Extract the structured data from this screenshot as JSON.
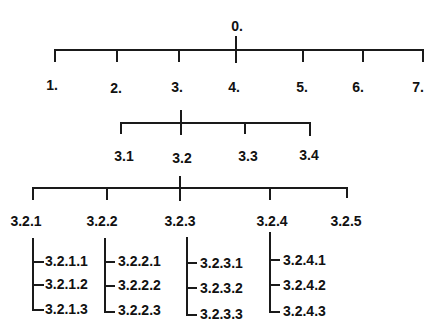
{
  "diagram": {
    "type": "hierarchy-tree",
    "root": {
      "label": "0.",
      "x": 236
    },
    "level1": [
      {
        "label": "1.",
        "x": 54
      },
      {
        "label": "2.",
        "x": 117
      },
      {
        "label": "3.",
        "x": 179
      },
      {
        "label": "4.",
        "x": 235
      },
      {
        "label": "5.",
        "x": 302
      },
      {
        "label": "6.",
        "x": 363
      },
      {
        "label": "7.",
        "x": 423
      }
    ],
    "level2": [
      {
        "label": "3.1",
        "x": 121
      },
      {
        "label": "3.2",
        "x": 181
      },
      {
        "label": "3.3",
        "x": 245
      },
      {
        "label": "3.4",
        "x": 310
      }
    ],
    "level3": [
      {
        "label": "3.2.1",
        "x": 33
      },
      {
        "label": "3.2.2",
        "x": 107
      },
      {
        "label": "3.2.3",
        "x": 180
      },
      {
        "label": "3.2.4",
        "x": 270
      },
      {
        "label": "3.2.5",
        "x": 347
      }
    ],
    "level4": [
      {
        "parent": "3.2.1",
        "x": 33,
        "items": [
          "3.2.1.1",
          "3.2.1.2",
          "3.2.1.3"
        ]
      },
      {
        "parent": "3.2.2",
        "x": 104,
        "items": [
          "3.2.2.1",
          "3.2.2.2",
          "3.2.2.3"
        ]
      },
      {
        "parent": "3.2.3",
        "x": 186,
        "items": [
          "3.2.3.1",
          "3.2.3.2",
          "3.2.3.3"
        ]
      },
      {
        "parent": "3.2.4",
        "x": 270,
        "items": [
          "3.2.4.1",
          "3.2.4.2",
          "3.2.4.3"
        ]
      }
    ]
  }
}
